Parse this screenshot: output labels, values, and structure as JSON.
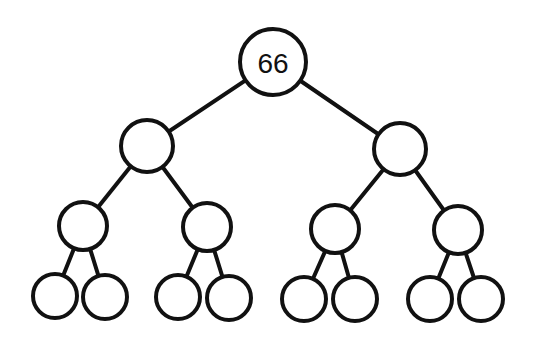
{
  "diagram": {
    "type": "binary-tree",
    "depth": 4,
    "nodes": [
      {
        "id": "n0",
        "label": "66",
        "cx": 273,
        "cy": 62,
        "r": 33
      },
      {
        "id": "n1",
        "label": "",
        "cx": 147,
        "cy": 146,
        "r": 26
      },
      {
        "id": "n2",
        "label": "",
        "cx": 400,
        "cy": 149,
        "r": 26
      },
      {
        "id": "n3",
        "label": "",
        "cx": 83,
        "cy": 226,
        "r": 24
      },
      {
        "id": "n4",
        "label": "",
        "cx": 207,
        "cy": 227,
        "r": 24
      },
      {
        "id": "n5",
        "label": "",
        "cx": 335,
        "cy": 229,
        "r": 24
      },
      {
        "id": "n6",
        "label": "",
        "cx": 458,
        "cy": 230,
        "r": 24
      },
      {
        "id": "n7",
        "label": "",
        "cx": 55,
        "cy": 296,
        "r": 22
      },
      {
        "id": "n8",
        "label": "",
        "cx": 105,
        "cy": 297,
        "r": 22
      },
      {
        "id": "n9",
        "label": "",
        "cx": 178,
        "cy": 297,
        "r": 22
      },
      {
        "id": "n10",
        "label": "",
        "cx": 229,
        "cy": 298,
        "r": 22
      },
      {
        "id": "n11",
        "label": "",
        "cx": 304,
        "cy": 299,
        "r": 22
      },
      {
        "id": "n12",
        "label": "",
        "cx": 355,
        "cy": 299,
        "r": 22
      },
      {
        "id": "n13",
        "label": "",
        "cx": 430,
        "cy": 299,
        "r": 22
      },
      {
        "id": "n14",
        "label": "",
        "cx": 481,
        "cy": 299,
        "r": 22
      }
    ],
    "edges": [
      [
        "n0",
        "n1"
      ],
      [
        "n0",
        "n2"
      ],
      [
        "n1",
        "n3"
      ],
      [
        "n1",
        "n4"
      ],
      [
        "n2",
        "n5"
      ],
      [
        "n2",
        "n6"
      ],
      [
        "n3",
        "n7"
      ],
      [
        "n3",
        "n8"
      ],
      [
        "n4",
        "n9"
      ],
      [
        "n4",
        "n10"
      ],
      [
        "n5",
        "n11"
      ],
      [
        "n5",
        "n12"
      ],
      [
        "n6",
        "n13"
      ],
      [
        "n6",
        "n14"
      ]
    ]
  }
}
